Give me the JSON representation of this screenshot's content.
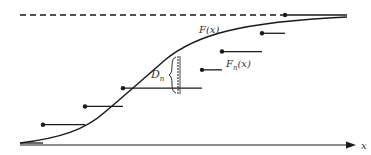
{
  "figure": {
    "colors": {
      "ink": "#1a1a1a",
      "background": "#ffffff"
    },
    "labels": {
      "continuous_cdf": "F(x)",
      "empirical_cdf_main": "F",
      "empirical_cdf_sub": "n",
      "empirical_cdf_arg": "(x)",
      "distance_main": "D",
      "distance_sub": "n",
      "x_axis": "x"
    },
    "upper_asymptote": {
      "level": 1,
      "style": "dashed"
    },
    "empirical_steps": [
      {
        "level": 1,
        "of": 7
      },
      {
        "level": 2,
        "of": 7
      },
      {
        "level": 3,
        "of": 7
      },
      {
        "level": 4,
        "of": 7
      },
      {
        "level": 5,
        "of": 7
      },
      {
        "level": 6,
        "of": 7
      },
      {
        "level": 7,
        "of": 7
      }
    ]
  }
}
